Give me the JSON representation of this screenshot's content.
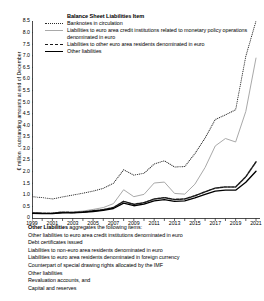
{
  "chart_data": {
    "type": "line",
    "title": "",
    "xlabel": "",
    "ylabel": "€ million , outstanding amounts at end of December",
    "xlim": [
      1999,
      2021
    ],
    "ylim": [
      0,
      8.5
    ],
    "ytick_step": 0.5,
    "grid": false,
    "legend_position": "top-left",
    "legend_title": "Balance Sheet Liabilities Item",
    "x": [
      1999,
      2000,
      2001,
      2002,
      2003,
      2004,
      2005,
      2006,
      2007,
      2008,
      2009,
      2010,
      2011,
      2012,
      2013,
      2014,
      2015,
      2016,
      2017,
      2018,
      2019,
      2020,
      2021
    ],
    "xtick_labels": [
      "1999",
      "2001",
      "2003",
      "2005",
      "2007",
      "2009",
      "2011",
      "2013",
      "2015",
      "2017",
      "2019",
      "2021"
    ],
    "ytick_labels": [
      "0",
      "0.5",
      "1.0",
      "1.5",
      "2.0",
      "2.5",
      "3.0",
      "3.5",
      "4.0",
      "4.5",
      "5.0",
      "5.5",
      "6.0",
      "6.5",
      "7.0",
      "7.5",
      "8.0",
      "8.5"
    ],
    "series": [
      {
        "name": "Banknotes in circulation",
        "style": "dotted",
        "color": "#2b2b2b",
        "values": [
          0.92,
          0.88,
          0.82,
          0.91,
          0.99,
          1.07,
          1.16,
          1.28,
          1.5,
          2.08,
          1.85,
          1.93,
          2.33,
          2.47,
          2.2,
          2.22,
          2.78,
          3.45,
          4.25,
          4.45,
          4.67,
          6.98,
          8.5
        ]
      },
      {
        "name": "Liabilities to euro area credit institutions related to monetary policy operations denominated in euro",
        "style": "solid",
        "color": "#a9a9a9",
        "values": [
          0.22,
          0.2,
          0.19,
          0.22,
          0.26,
          0.3,
          0.37,
          0.45,
          0.62,
          1.22,
          0.92,
          1.02,
          1.51,
          1.55,
          1.06,
          1.03,
          1.46,
          2.18,
          3.11,
          3.43,
          3.28,
          4.6,
          6.9
        ]
      },
      {
        "name": "Liabilities to other euro area residents denominated in euro",
        "style": "dashed",
        "color": "#1a1a1a",
        "values": [
          0.22,
          0.21,
          0.21,
          0.25,
          0.24,
          0.26,
          0.31,
          0.36,
          0.45,
          0.72,
          0.59,
          0.66,
          0.82,
          0.88,
          0.8,
          0.82,
          0.96,
          1.13,
          1.29,
          1.34,
          1.34,
          1.78,
          2.42
        ]
      },
      {
        "name": "Other liabilities",
        "style": "solid",
        "color": "#000000",
        "values": [
          0.2,
          0.19,
          0.19,
          0.22,
          0.22,
          0.24,
          0.28,
          0.33,
          0.41,
          0.64,
          0.53,
          0.6,
          0.74,
          0.79,
          0.72,
          0.74,
          0.87,
          1.02,
          1.16,
          1.2,
          1.2,
          1.54,
          2.02
        ]
      }
    ]
  },
  "footnote": {
    "head_bold": "Other Liabilities",
    "head_rest": " aggregates the following items:",
    "items": [
      "Other liabilities to euro area credit institutions denominated in euro",
      "Debt certificates issued",
      "Liabilities to non-euro area residents denominated in euro",
      "Liabilities to euro area residents denominated in foreign currency",
      "Counterpart of special drawing rights allocated by the IMF",
      "Other liabilities",
      "Revaluation accounts, and",
      "Capital and reserves"
    ]
  }
}
